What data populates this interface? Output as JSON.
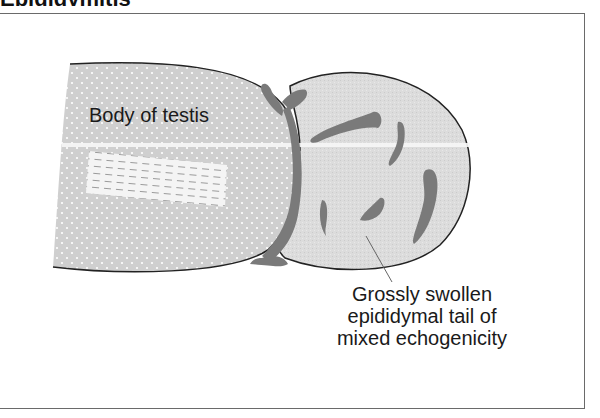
{
  "figure": {
    "heading_clipped": "Epididymitis",
    "labels": {
      "testis": "Body of testis",
      "epididymis_lines": [
        "Grossly swollen",
        "epididymal tail of",
        "mixed echogenicity"
      ]
    },
    "colors": {
      "testis_fill": "#cfcfcf",
      "epididymis_fill": "#dcdcdc",
      "hypoechoic_blobs": "#7a7a7a",
      "outline": "#222222",
      "frame": "#6a6a6a",
      "hatch_fill": "#f4f4f4",
      "hatch_lines": "#9a9a9a"
    }
  }
}
